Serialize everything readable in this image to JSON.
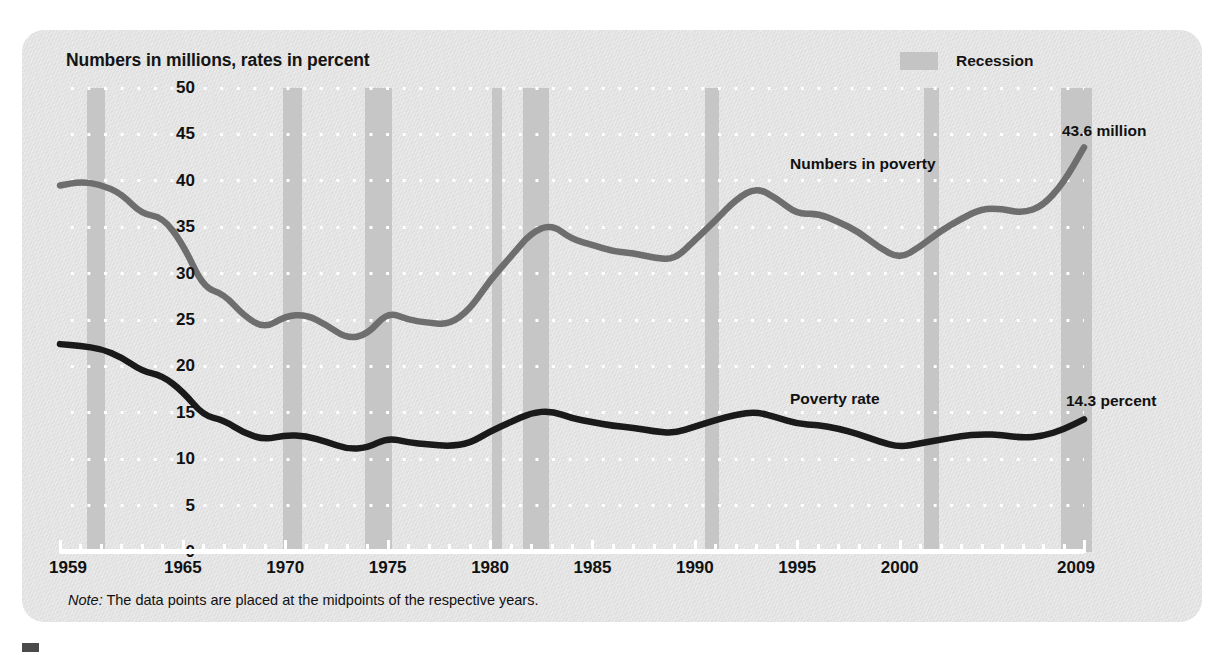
{
  "axis_title": "Numbers in millions, rates in percent",
  "legend": {
    "label": "Recession"
  },
  "annotations": {
    "numbers_series": "Numbers in poverty",
    "rate_series": "Poverty rate",
    "numbers_end": "43.6 million",
    "rate_end": "14.3 percent"
  },
  "note": {
    "prefix": "Note:",
    "text": " The data points are placed at the midpoints of the respective years."
  },
  "chart_data": {
    "type": "line",
    "title": "Numbers in millions, rates in percent",
    "xlabel": "",
    "ylabel": "Numbers in millions, rates in percent",
    "xlim": [
      1959,
      2009
    ],
    "ylim": [
      0,
      50
    ],
    "ytick_labels": [
      "0",
      "5",
      "10",
      "15",
      "20",
      "25",
      "30",
      "35",
      "40",
      "45",
      "50"
    ],
    "yticks": [
      0,
      5,
      10,
      15,
      20,
      25,
      30,
      35,
      40,
      45,
      50
    ],
    "xtick_labels": [
      "1959",
      "1965",
      "1970",
      "1975",
      "1980",
      "1985",
      "1990",
      "1995",
      "2000",
      "2009"
    ],
    "xticks": [
      1959,
      1965,
      1970,
      1975,
      1980,
      1985,
      1990,
      1995,
      2000,
      2009
    ],
    "grid": "horizontal-dotted-white",
    "legend_position": "top-right",
    "x": [
      1959,
      1960,
      1961,
      1962,
      1963,
      1964,
      1965,
      1966,
      1967,
      1968,
      1969,
      1970,
      1971,
      1972,
      1973,
      1974,
      1975,
      1976,
      1977,
      1978,
      1979,
      1980,
      1981,
      1982,
      1983,
      1984,
      1985,
      1986,
      1987,
      1988,
      1989,
      1990,
      1991,
      1992,
      1993,
      1994,
      1995,
      1996,
      1997,
      1998,
      1999,
      2000,
      2001,
      2002,
      2003,
      2004,
      2005,
      2006,
      2007,
      2008,
      2009
    ],
    "series": [
      {
        "name": "Numbers in poverty",
        "color": "#6e6e6e",
        "unit": "millions",
        "end_label": "43.6 million",
        "values": [
          39.5,
          39.9,
          39.6,
          38.6,
          36.4,
          36.1,
          33.2,
          28.5,
          27.8,
          25.4,
          24.1,
          25.4,
          25.6,
          24.5,
          23.0,
          23.4,
          25.9,
          25.0,
          24.7,
          24.5,
          26.1,
          29.3,
          31.8,
          34.4,
          35.3,
          33.7,
          33.1,
          32.4,
          32.2,
          31.7,
          31.5,
          33.6,
          35.7,
          38.0,
          39.3,
          38.1,
          36.4,
          36.5,
          35.6,
          34.5,
          32.8,
          31.6,
          32.9,
          34.6,
          35.9,
          37.0,
          37.0,
          36.5,
          37.3,
          39.8,
          43.6
        ]
      },
      {
        "name": "Poverty rate",
        "color": "#1a1a1a",
        "unit": "percent",
        "end_label": "14.3 percent",
        "values": [
          22.4,
          22.2,
          21.9,
          21.0,
          19.5,
          19.0,
          17.3,
          14.7,
          14.2,
          12.8,
          12.1,
          12.6,
          12.5,
          11.9,
          11.1,
          11.2,
          12.3,
          11.8,
          11.6,
          11.4,
          11.7,
          13.0,
          14.0,
          15.0,
          15.2,
          14.4,
          14.0,
          13.6,
          13.4,
          13.0,
          12.8,
          13.5,
          14.2,
          14.8,
          15.1,
          14.5,
          13.8,
          13.7,
          13.3,
          12.7,
          11.9,
          11.3,
          11.7,
          12.1,
          12.5,
          12.7,
          12.6,
          12.3,
          12.5,
          13.2,
          14.3
        ]
      }
    ],
    "recession_bands": [
      {
        "start": 1960.3,
        "end": 1961.2
      },
      {
        "start": 1969.9,
        "end": 1970.8
      },
      {
        "start": 1973.9,
        "end": 1975.2
      },
      {
        "start": 1980.1,
        "end": 1980.6
      },
      {
        "start": 1981.6,
        "end": 1982.9
      },
      {
        "start": 1990.5,
        "end": 1991.2
      },
      {
        "start": 2001.2,
        "end": 2001.9
      },
      {
        "start": 2007.9,
        "end": 2009.4
      }
    ]
  }
}
